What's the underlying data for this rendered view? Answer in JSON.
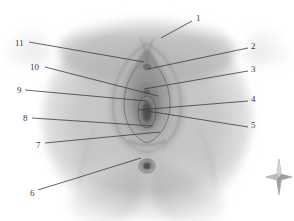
{
  "page": {
    "width": 294,
    "height": 221,
    "background": "#ffffff",
    "kind": "anatomical-illustration-figure"
  },
  "figure": {
    "name": "external-genitalia-perineum-illustration",
    "style": "grayscale-pencil-shading",
    "base_tone": "#c9c9c9",
    "mid_tone": "#a8a8a8",
    "dark_tone": "#6f6f6f",
    "line_color": "#3b3b3b"
  },
  "callouts": {
    "line_color": "#3b3b3b",
    "items": [
      {
        "id": "callout-1",
        "label": "1",
        "num_x": 196,
        "num_y": 14,
        "x1": 192,
        "y1": 21,
        "x2": 161,
        "y2": 38
      },
      {
        "id": "callout-2",
        "label": "2",
        "num_x": 251,
        "num_y": 42,
        "x1": 248,
        "y1": 48,
        "x2": 148,
        "y2": 69
      },
      {
        "id": "callout-3",
        "label": "3",
        "num_x": 251,
        "num_y": 65,
        "x1": 248,
        "y1": 71,
        "x2": 144,
        "y2": 89
      },
      {
        "id": "callout-4",
        "label": "4",
        "num_x": 251,
        "num_y": 95,
        "x1": 248,
        "y1": 101,
        "x2": 138,
        "y2": 110
      },
      {
        "id": "callout-5",
        "label": "5",
        "num_x": 251,
        "num_y": 121,
        "x1": 248,
        "y1": 127,
        "x2": 147,
        "y2": 111
      },
      {
        "id": "callout-6",
        "label": "6",
        "num_x": 30,
        "num_y": 189,
        "x1": 38,
        "y1": 190,
        "x2": 141,
        "y2": 158
      },
      {
        "id": "callout-7",
        "label": "7",
        "num_x": 36,
        "num_y": 141,
        "x1": 45,
        "y1": 143,
        "x2": 160,
        "y2": 132
      },
      {
        "id": "callout-8",
        "label": "8",
        "num_x": 23,
        "num_y": 114,
        "x1": 32,
        "y1": 118,
        "x2": 153,
        "y2": 126
      },
      {
        "id": "callout-9",
        "label": "9",
        "num_x": 17,
        "num_y": 86,
        "x1": 25,
        "y1": 90,
        "x2": 147,
        "y2": 101
      },
      {
        "id": "callout-10",
        "label": "10",
        "num_x": 30,
        "num_y": 63,
        "x1": 45,
        "y1": 67,
        "x2": 158,
        "y2": 96
      },
      {
        "id": "callout-11",
        "label": "11",
        "num_x": 15,
        "num_y": 39,
        "x1": 29,
        "y1": 42,
        "x2": 144,
        "y2": 62
      }
    ]
  },
  "compass": {
    "name": "four-pointed-star-icon",
    "color": "#9a9a9a",
    "highlight": "#d8d8d8"
  }
}
